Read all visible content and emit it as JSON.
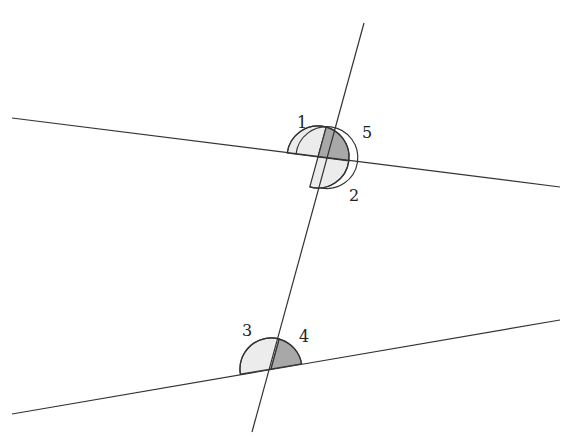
{
  "diagram": {
    "type": "geometry",
    "colors": {
      "line": "#333333",
      "light_fill": "#ececec",
      "dark_fill": "#a8a8a8",
      "background": "#ffffff"
    },
    "lines": {
      "upper": {
        "x1": 12,
        "y1": 118,
        "x2": 560,
        "y2": 187
      },
      "lower": {
        "x1": 12,
        "y1": 414,
        "x2": 560,
        "y2": 320
      },
      "transversal": {
        "x1": 364,
        "y1": 23,
        "x2": 252,
        "y2": 432
      }
    },
    "intersections": {
      "upper": {
        "x": 318,
        "y": 157
      },
      "lower": {
        "x": 271,
        "y": 369
      }
    },
    "angles": [
      {
        "id": "1",
        "label": "1",
        "shade": "light"
      },
      {
        "id": "5",
        "label": "5",
        "shade": "dark"
      },
      {
        "id": "2",
        "label": "2",
        "shade": "light"
      },
      {
        "id": "3",
        "label": "3",
        "shade": "light"
      },
      {
        "id": "4",
        "label": "4",
        "shade": "dark"
      }
    ],
    "labels": {
      "a1": "1",
      "a2": "2",
      "a3": "3",
      "a4": "4",
      "a5": "5"
    }
  }
}
